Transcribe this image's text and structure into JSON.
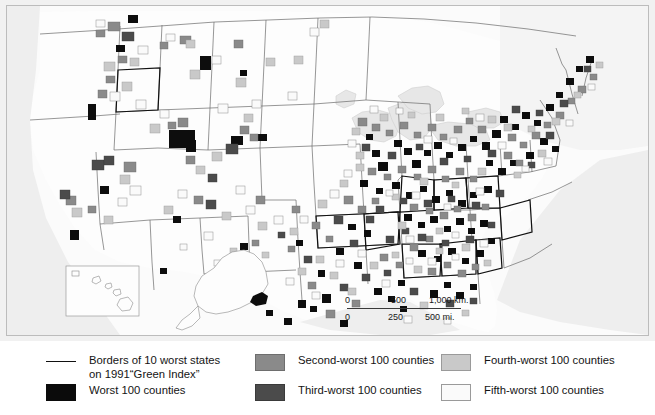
{
  "map": {
    "title": "",
    "background_color": "#f2f2f2",
    "land_color": "#fdfdfd",
    "water_color": "#e9e9e9",
    "border_color": "#555555",
    "scalebar": {
      "km_ticks": [
        "0",
        "500",
        "1,000 km."
      ],
      "mi_ticks": [
        "0",
        "250",
        "500 mi."
      ]
    }
  },
  "legend": {
    "entries": [
      {
        "key": "state-borders",
        "swatch": "rule",
        "label": "Borders of 10 worst states\non 1991“Green Index”",
        "color": "#111111"
      },
      {
        "key": "worst",
        "swatch": "c1",
        "label": "Worst 100 counties",
        "color": "#0b0b0b"
      },
      {
        "key": "second-worst",
        "swatch": "c2",
        "label": "Second-worst 100 counties",
        "color": "#8a8a8a"
      },
      {
        "key": "third-worst",
        "swatch": "c3",
        "label": "Third-worst 100 counties",
        "color": "#4b4b4b"
      },
      {
        "key": "fourth-worst",
        "swatch": "c4",
        "label": "Fourth-worst 100 counties",
        "color": "#c9c9c9"
      },
      {
        "key": "fifth-worst",
        "swatch": "c5",
        "label": "Fifth-worst 100 counties",
        "color": "#fafafa"
      }
    ]
  }
}
